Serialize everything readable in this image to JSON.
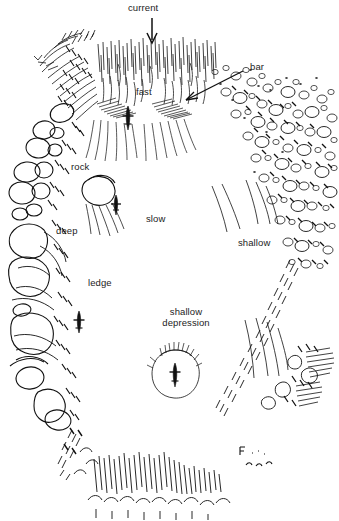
{
  "figure": {
    "width": 339,
    "height": 521,
    "style": "pen-and-ink line drawing",
    "ink_color": "#111111",
    "background_color": "#ffffff"
  },
  "labels": {
    "current": "current",
    "bar": "bar",
    "fast": "fast",
    "rock": "rock",
    "deep": "deep",
    "slow": "slow",
    "shallow": "shallow",
    "ledge": "ledge",
    "shallow_depression_line1": "shallow",
    "shallow_depression_line2": "depression"
  },
  "annotations": {
    "current_arrow": "downward arrow indicating flow direction at top center",
    "bar_arrow": "leader line with arrowhead pointing down-left to the gravel bar"
  },
  "features": [
    {
      "name": "current",
      "label": "current",
      "position": "top-center",
      "marker": "arrow-down"
    },
    {
      "name": "fast-water",
      "label": "fast",
      "position": "upper-center"
    },
    {
      "name": "gravel-bar",
      "label": "bar",
      "position": "upper-right",
      "marker": "arrow-leader"
    },
    {
      "name": "rock",
      "label": "rock",
      "position": "left-upper"
    },
    {
      "name": "deep-water",
      "label": "deep",
      "position": "left"
    },
    {
      "name": "slow-water",
      "label": "slow",
      "position": "center"
    },
    {
      "name": "shallow-water",
      "label": "shallow",
      "position": "right"
    },
    {
      "name": "ledge",
      "label": "ledge",
      "position": "left-lower"
    },
    {
      "name": "shallow-depression",
      "label": "shallow depression",
      "position": "lower-center"
    }
  ]
}
